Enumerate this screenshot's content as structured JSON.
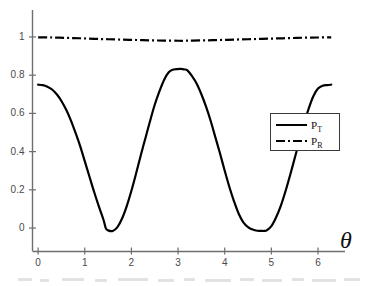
{
  "chart_data": {
    "type": "line",
    "title": "",
    "subtitle": "",
    "xlabel": "θ",
    "ylabel": "",
    "xlim": [
      -0.12,
      6.45
    ],
    "ylim": [
      -0.12,
      1.12
    ],
    "xticks": [
      0,
      1,
      2,
      3,
      4,
      5,
      6
    ],
    "xtick_labels": [
      "0",
      "1",
      "2",
      "3",
      "4",
      "5",
      "6"
    ],
    "yticks": [
      0,
      0.2,
      0.4,
      0.6,
      0.8,
      1
    ],
    "ytick_labels": [
      "0",
      "0.2",
      "0.4",
      "0.6",
      "0.8",
      "1"
    ],
    "grid": false,
    "legend_position": "center-right",
    "legend_entries": [
      "P_T",
      "P_R"
    ],
    "background_color": "#ffffff",
    "axis_color": "#6e6e6e",
    "series": [
      {
        "name": "P_T",
        "label_base": "P",
        "label_sub": "T",
        "style": "solid",
        "color": "#000000",
        "line_width": 2.2,
        "description": "Transmission probability oscillating with period pi; maxima ~0.83 near theta=pi, minima ~-0.015 near theta=1.45 and theta=4.85, value 0.75 at theta=0 and theta=2pi",
        "x": [
          0,
          0.1,
          0.2,
          0.3,
          0.4,
          0.5,
          0.6,
          0.7,
          0.8,
          0.9,
          1.0,
          1.1,
          1.2,
          1.3,
          1.4,
          1.45,
          1.5,
          1.6,
          1.7,
          1.8,
          1.9,
          2.0,
          2.1,
          2.2,
          2.3,
          2.4,
          2.5,
          2.6,
          2.7,
          2.8,
          2.9,
          3.0,
          3.05,
          3.1,
          3.14,
          3.2,
          3.3,
          3.4,
          3.5,
          3.6,
          3.7,
          3.8,
          3.9,
          4.0,
          4.1,
          4.2,
          4.3,
          4.4,
          4.5,
          4.6,
          4.7,
          4.8,
          4.85,
          4.9,
          5.0,
          5.1,
          5.2,
          5.3,
          5.4,
          5.5,
          5.6,
          5.7,
          5.8,
          5.9,
          6.0,
          6.1,
          6.2,
          6.283
        ],
        "y": [
          0.75,
          0.748,
          0.74,
          0.725,
          0.7,
          0.665,
          0.62,
          0.565,
          0.5,
          0.43,
          0.35,
          0.27,
          0.19,
          0.115,
          0.045,
          0.0,
          -0.012,
          -0.015,
          0.005,
          0.05,
          0.115,
          0.195,
          0.285,
          0.38,
          0.47,
          0.56,
          0.645,
          0.715,
          0.775,
          0.815,
          0.83,
          0.832,
          0.833,
          0.832,
          0.83,
          0.825,
          0.795,
          0.755,
          0.7,
          0.635,
          0.56,
          0.475,
          0.39,
          0.3,
          0.215,
          0.14,
          0.075,
          0.03,
          0.005,
          -0.008,
          -0.014,
          -0.015,
          -0.015,
          -0.012,
          0.01,
          0.055,
          0.115,
          0.19,
          0.275,
          0.365,
          0.455,
          0.545,
          0.625,
          0.69,
          0.73,
          0.745,
          0.748,
          0.75
        ]
      },
      {
        "name": "P_R",
        "label_base": "P",
        "label_sub": "R",
        "style": "dashdot",
        "color": "#000000",
        "line_width": 2.2,
        "description": "Reflection probability, nearly constant just below 1 with a shallow dip around theta=pi",
        "x": [
          0,
          0.3,
          0.6,
          0.9,
          1.2,
          1.5,
          1.8,
          2.1,
          2.4,
          2.7,
          3.0,
          3.14,
          3.3,
          3.6,
          3.9,
          4.2,
          4.5,
          4.8,
          5.1,
          5.4,
          5.7,
          6.0,
          6.283
        ],
        "y": [
          0.998,
          0.997,
          0.995,
          0.993,
          0.99,
          0.988,
          0.986,
          0.984,
          0.982,
          0.981,
          0.98,
          0.98,
          0.981,
          0.982,
          0.984,
          0.986,
          0.988,
          0.99,
          0.992,
          0.994,
          0.996,
          0.997,
          0.998
        ]
      }
    ]
  },
  "axis": {
    "theta_symbol": "θ"
  }
}
